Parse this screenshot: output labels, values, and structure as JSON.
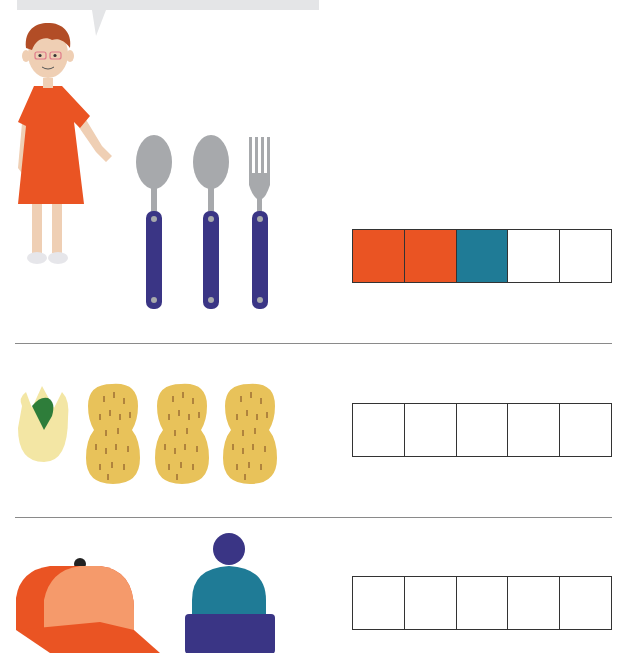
{
  "worksheet": {
    "speech_bubble": {
      "text": ""
    },
    "character": {
      "name": "child-in-orange-dress"
    },
    "colors": {
      "orange": "#ea5423",
      "teal": "#1f7b96",
      "empty": "#ffffff",
      "navy": "#3a3585",
      "silver": "#a7a9ac",
      "peanut": "#e8c25a",
      "pistachio_shell": "#f3e6a4",
      "pistachio_nut": "#2e7d3a",
      "cap_light": "#f59a6b",
      "cap_dark": "#ea5423",
      "beanie": "#1f7b96"
    },
    "rows": [
      {
        "items": [
          "spoon",
          "spoon",
          "fork"
        ],
        "boxes": [
          "orange",
          "orange",
          "teal",
          "empty",
          "empty"
        ]
      },
      {
        "items": [
          "pistachio",
          "peanut",
          "peanut",
          "peanut"
        ],
        "boxes": [
          "empty",
          "empty",
          "empty",
          "empty",
          "empty"
        ]
      },
      {
        "items": [
          "baseball-cap",
          "beanie"
        ],
        "boxes": [
          "empty",
          "empty",
          "empty",
          "empty",
          "empty"
        ]
      }
    ]
  }
}
